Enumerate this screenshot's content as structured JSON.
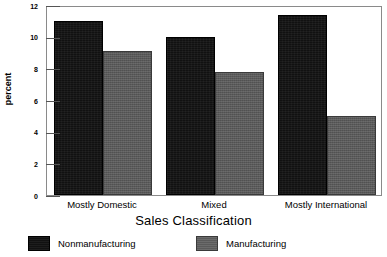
{
  "chart_data": {
    "type": "bar",
    "title": "",
    "subtitle": "",
    "xlabel": "Sales Classification",
    "ylabel": "percent",
    "categories": [
      "Mostly Domestic",
      "Mixed",
      "Mostly International"
    ],
    "series": [
      {
        "name": "Nonmanufacturing",
        "color": "#111111",
        "values": [
          11.0,
          10.0,
          11.4
        ]
      },
      {
        "name": "Manufacturing",
        "color": "#5a5a5a",
        "values": [
          9.1,
          7.75,
          5.0
        ]
      }
    ],
    "ylim": [
      0,
      12
    ],
    "yticks": [
      0,
      2,
      4,
      6,
      8,
      10,
      12
    ],
    "ytick_labels": [
      "0",
      "2",
      "4",
      "6",
      "8",
      "10",
      "12"
    ],
    "grid": false,
    "legend_position": "bottom",
    "frame": true
  },
  "axis": {
    "y_title": "percent",
    "x_title": "Sales Classification"
  },
  "legend": {
    "items": [
      {
        "label": "Nonmanufacturing",
        "swatch": "dark-swatch"
      },
      {
        "label": "Manufacturing",
        "swatch": "gray-swatch"
      }
    ]
  }
}
